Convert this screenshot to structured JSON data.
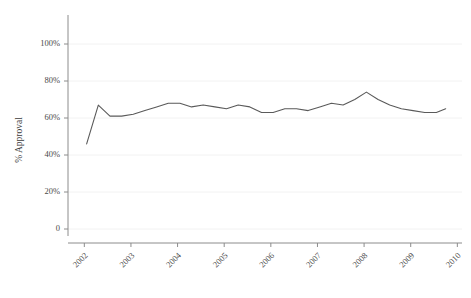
{
  "chart_data": {
    "type": "line",
    "title": "",
    "subtitle": "",
    "xlabel": "",
    "ylabel": "% Approval",
    "grid": true,
    "grid_axis": "y",
    "legend": false,
    "legend_position": "none",
    "line_color": "#5a5a5a",
    "axis_color": "#8c8c8c",
    "grid_color": "#f2f2f2",
    "text_color": "#4a4a4a",
    "background_color": "#ffffff",
    "xlim": [
      2001.65,
      2010.1
    ],
    "ylim": [
      0,
      110
    ],
    "ytick_values": [
      0,
      20,
      40,
      60,
      80,
      100
    ],
    "ytick_labels": [
      "0",
      "20%",
      "40%",
      "60%",
      "80%",
      "100%"
    ],
    "xtick_values": [
      2002,
      2003,
      2004,
      2005,
      2006,
      2007,
      2008,
      2009,
      2010
    ],
    "xtick_labels": [
      "2002",
      "2003",
      "2004",
      "2005",
      "2006",
      "2007",
      "2008",
      "2009",
      "2010"
    ],
    "xtick_rotation": 45,
    "series": [
      {
        "name": "% Approval",
        "x": [
          2002.05,
          2002.3,
          2002.55,
          2002.8,
          2003.05,
          2003.3,
          2003.55,
          2003.8,
          2004.05,
          2004.3,
          2004.55,
          2004.8,
          2005.05,
          2005.3,
          2005.55,
          2005.8,
          2006.05,
          2006.3,
          2006.55,
          2006.8,
          2007.05,
          2007.3,
          2007.55,
          2007.8,
          2008.05,
          2008.3,
          2008.55,
          2008.8,
          2009.05,
          2009.3,
          2009.55,
          2009.75
        ],
        "values": [
          46,
          67,
          61,
          61,
          62,
          64,
          66,
          68,
          68,
          66,
          67,
          66,
          65,
          67,
          66,
          63,
          63,
          65,
          65,
          64,
          66,
          68,
          67,
          70,
          74,
          70,
          67,
          65,
          64,
          63,
          63,
          65
        ]
      }
    ]
  }
}
